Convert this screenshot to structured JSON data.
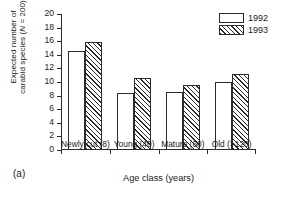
{
  "panel": {
    "label": "(a)"
  },
  "chart_data": {
    "type": "bar",
    "title": "",
    "subtitle": "",
    "xlabel": "Age class (years)",
    "ylabel_line1": "Expected number of",
    "ylabel_line2_pre": "carabid species (",
    "ylabel_line2_italic": "N",
    "ylabel_line2_post": " = 200)",
    "ylabel": "Expected number of carabid species (N = 200)",
    "categories": [
      "Newly cut (8)",
      "Young (40)",
      "Mature (60)",
      "Old (>120)"
    ],
    "series": [
      {
        "name": "1992",
        "values": [
          14.5,
          8.4,
          8.5,
          10.0
        ]
      },
      {
        "name": "1993",
        "values": [
          15.9,
          10.6,
          9.6,
          11.2
        ]
      }
    ],
    "ylim": [
      0,
      20
    ],
    "yticks": [
      0,
      2,
      4,
      6,
      8,
      10,
      12,
      14,
      16,
      18,
      20
    ],
    "ytick_labels": [
      "0",
      "2",
      "4",
      "6",
      "8",
      "10",
      "12",
      "14",
      "16",
      "18",
      "20"
    ],
    "grid": false,
    "legend_position": "top-right",
    "legend": [
      {
        "label": "1992",
        "fill": "white"
      },
      {
        "label": "1993",
        "fill": "hatched"
      }
    ],
    "colors": {
      "axis": "#2b2b2b",
      "bar_1992": "#ffffff",
      "bar_1993_hatch": "#2b2b2b",
      "background": "#ffffff"
    }
  }
}
